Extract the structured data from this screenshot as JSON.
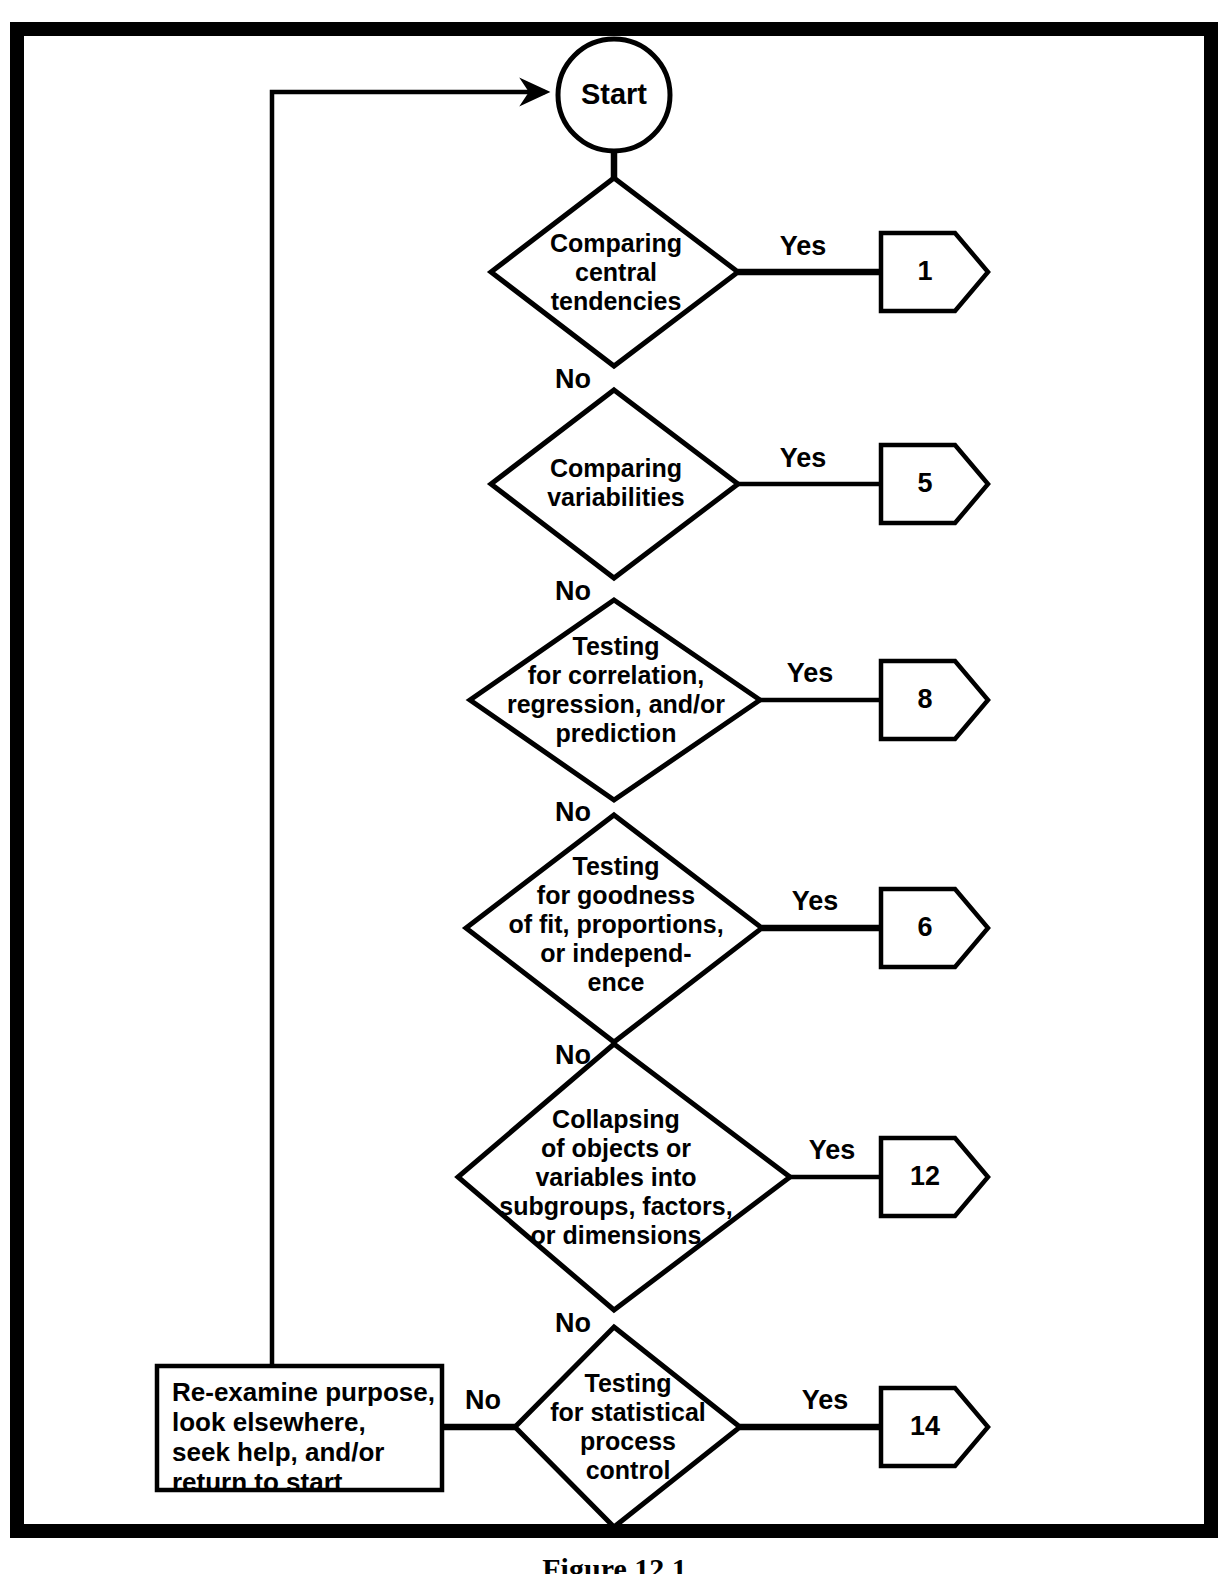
{
  "figure": {
    "caption": "Figure 12.1",
    "border_color": "#000000",
    "background_color": "#ffffff",
    "line_color": "#000000"
  },
  "start_node": {
    "label": "Start",
    "shape": "circle"
  },
  "terminal_box": {
    "lines": [
      "Re-examine purpose,",
      "look elsewhere,",
      "seek help, and/or",
      "return to start"
    ],
    "shape": "rectangle"
  },
  "branch_labels": {
    "yes": "Yes",
    "no": "No"
  },
  "decisions": [
    {
      "id": "central-tendencies",
      "lines": [
        "Comparing",
        "central",
        "tendencies"
      ],
      "yes_label": "Yes",
      "no_label": "No",
      "yes_target": "1"
    },
    {
      "id": "variabilities",
      "lines": [
        "Comparing",
        "variabilities"
      ],
      "yes_label": "Yes",
      "no_label": "No",
      "yes_target": "5"
    },
    {
      "id": "correlation-regression",
      "lines": [
        "Testing",
        "for correlation,",
        "regression, and/or",
        "prediction"
      ],
      "yes_label": "Yes",
      "no_label": "No",
      "yes_target": "8"
    },
    {
      "id": "goodness-of-fit",
      "lines": [
        "Testing",
        "for goodness",
        "of fit, proportions,",
        "or independ-",
        "ence"
      ],
      "yes_label": "Yes",
      "no_label": "No",
      "yes_target": "6"
    },
    {
      "id": "collapsing-variables",
      "lines": [
        "Collapsing",
        "of objects or",
        "variables into",
        "subgroups, factors,",
        "or dimensions"
      ],
      "yes_label": "Yes",
      "no_label": "No",
      "yes_target": "12"
    },
    {
      "id": "statistical-process-control",
      "lines": [
        "Testing",
        "for statistical",
        "process",
        "control"
      ],
      "yes_label": "Yes",
      "no_label": "No",
      "yes_target": "14"
    }
  ],
  "reference_markers": [
    "1",
    "5",
    "8",
    "6",
    "12",
    "14"
  ]
}
